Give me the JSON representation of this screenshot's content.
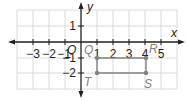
{
  "diagram": {
    "type": "coordinate-plane",
    "axes": {
      "x_label": "x",
      "y_label": "y",
      "origin_label": "O",
      "x_ticks": [
        "−3",
        "−2",
        "−1",
        "1",
        "2",
        "3",
        "4",
        "5"
      ],
      "y_ticks": [
        "1",
        "−1",
        "−2"
      ]
    },
    "grid": {
      "x_range": [
        -4,
        6
      ],
      "y_range": [
        -3,
        2
      ],
      "color": "#d1d3d4"
    },
    "points": [
      {
        "name": "Q",
        "x": 1,
        "y": -1
      },
      {
        "name": "R",
        "x": 4,
        "y": -1
      },
      {
        "name": "S",
        "x": 4,
        "y": -2
      },
      {
        "name": "T",
        "x": 1,
        "y": -2
      }
    ],
    "polygon": {
      "vertices": [
        "Q",
        "R",
        "S",
        "T"
      ],
      "color": "#808285"
    },
    "colors": {
      "axis": "#231f20",
      "shape": "#808285"
    }
  }
}
